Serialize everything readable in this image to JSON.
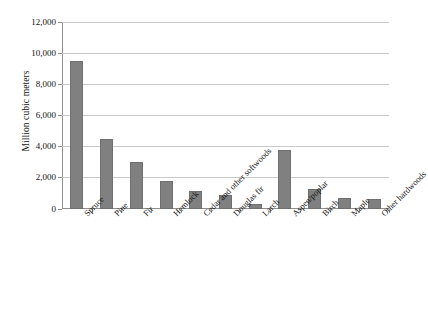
{
  "chart_data": {
    "type": "bar",
    "title": "",
    "subtitle": "",
    "xlabel": "",
    "ylabel": "Million cubic meters",
    "categories": [
      "Spruce",
      "Pine",
      "Fir",
      "Hemlock",
      "Cedar and other softwoods",
      "Douglas fir",
      "Larch",
      "Aspen/poplar",
      "Birch",
      "Maple",
      "Other hardwoods"
    ],
    "values": [
      9500,
      4500,
      3000,
      1750,
      1150,
      850,
      300,
      3750,
      1250,
      680,
      620
    ],
    "ylim": [
      0,
      12000
    ],
    "ytick_labels": [
      "0",
      "2,000",
      "4,000",
      "6,000",
      "8,000",
      "10,000",
      "12,000"
    ],
    "ytick_values": [
      0,
      2000,
      4000,
      6000,
      8000,
      10000,
      12000
    ],
    "grid": true,
    "legend": "none",
    "bar_color": "#808080",
    "gridline_color": "#c9c9c9",
    "axis_color": "#8f8f8f",
    "background_color": "#ffffff",
    "xtick_label_rotation": "-45"
  }
}
